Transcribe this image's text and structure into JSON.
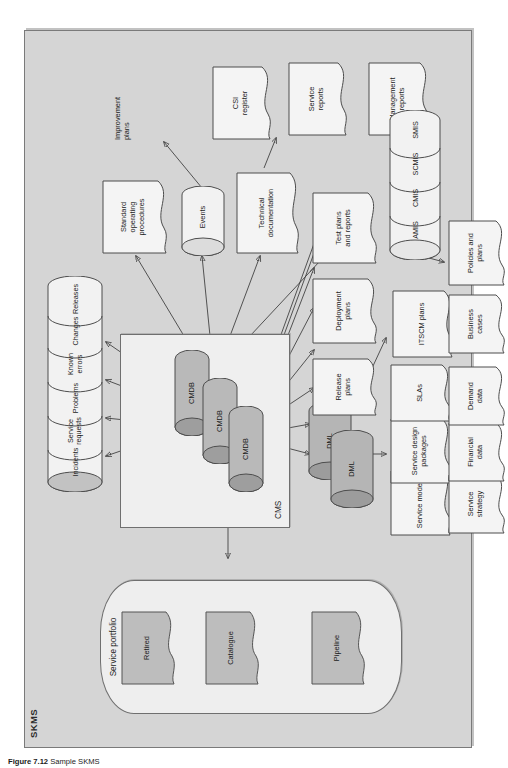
{
  "figure": {
    "caption_number": "Figure 7.12",
    "caption_text": "Sample SKMS"
  },
  "frame": {
    "label": "SKMS",
    "fill": "#d5d5d5",
    "stroke": "#7a7a7a"
  },
  "service_portfolio": {
    "title": "Service portfolio",
    "fill": "#eeeeee",
    "items": [
      {
        "label": "Pipeline",
        "fill": "#bdbdbd"
      },
      {
        "label": "Catalogue",
        "fill": "#bdbdbd"
      },
      {
        "label": "Retired",
        "fill": "#bdbdbd"
      }
    ]
  },
  "cms": {
    "title": "CMS",
    "fill": "#efefef",
    "cmdbs": [
      {
        "label": "CMDB",
        "fill": "#b9b9b9"
      },
      {
        "label": "CMDB",
        "fill": "#b9b9b9"
      },
      {
        "label": "CMDB",
        "fill": "#b9b9b9"
      }
    ]
  },
  "record_store": {
    "name": "service-records-cylinder-stack",
    "fill": "#f2f2f2",
    "segments": [
      "Incidents",
      "Service requests",
      "Problems",
      "Known errors",
      "Changes",
      "Releases"
    ]
  },
  "dml": {
    "items": [
      {
        "label": "DML",
        "fill": "#b5b5b5"
      },
      {
        "label": "DML",
        "fill": "#b5b5b5"
      }
    ]
  },
  "mis_store": {
    "name": "management-information-systems-stack",
    "fill": "#f2f2f2",
    "segments": [
      "AMIS",
      "CMIS",
      "SCMIS",
      "SMIS"
    ]
  },
  "documents": [
    {
      "id": "standard-operating-procedures",
      "label": "Standard\noperating\nprocedures"
    },
    {
      "id": "improvement-plans",
      "label": "Improvement\nplans"
    },
    {
      "id": "csi-register",
      "label": "CSI\nregister"
    },
    {
      "id": "service-reports",
      "label": "Service\nreports"
    },
    {
      "id": "management-reports",
      "label": "Management\nreports"
    },
    {
      "id": "technical-documentation",
      "label": "Technical\ndocumentation"
    },
    {
      "id": "release-plans",
      "label": "Release\nplans"
    },
    {
      "id": "deployment-plans",
      "label": "Deployment\nplans"
    },
    {
      "id": "test-plans-and-reports",
      "label": "Test plans\nand reports"
    },
    {
      "id": "itscm-plans",
      "label": "ITSCM plans"
    },
    {
      "id": "service-models",
      "label": "Service models"
    },
    {
      "id": "service-design-packages",
      "label": "Service design\npackages"
    },
    {
      "id": "slas",
      "label": "SLAs"
    },
    {
      "id": "service-strategy",
      "label": "Service\nstrategy"
    },
    {
      "id": "financial-data",
      "label": "Financial\ndata"
    },
    {
      "id": "demand-data",
      "label": "Demand\ndata"
    },
    {
      "id": "business-cases",
      "label": "Business\ncases"
    },
    {
      "id": "policies-and-plans",
      "label": "Policies and\nplans"
    }
  ],
  "events": {
    "label": "Events",
    "fill": "#f2f2f2"
  }
}
